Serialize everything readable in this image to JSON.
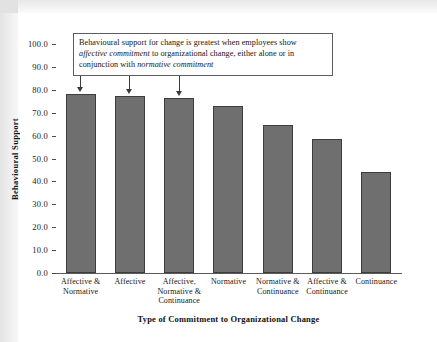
{
  "chart_data": {
    "type": "bar",
    "title": "",
    "xlabel": "Type of Commitment to Organizational Change",
    "ylabel": "Behavioural Support",
    "ylim": [
      0,
      100
    ],
    "ytick_step": 10,
    "grid": false,
    "legend": "none",
    "categories": [
      "Affective & Normative",
      "Affective",
      "Affective, Normative & Continuance",
      "Normative",
      "Normative & Continuance",
      "Affective & Continuance",
      "Continuance"
    ],
    "values": [
      78.0,
      77.2,
      76.5,
      73.0,
      64.5,
      58.5,
      44.0
    ],
    "ytick_labels": [
      "100.0",
      "90.0",
      "80.0",
      "70.0",
      "60.0",
      "50.0",
      "40.0",
      "30.0",
      "20.0",
      "10.0",
      "0.0"
    ],
    "bar_color": "#6f6f6f",
    "bar_edge_color": "#3d3d3d",
    "axis_color": "#5a5a5a",
    "annotation": {
      "line1_part1": "Behavioural support for change is greatest when employees show ",
      "line1_emphasis": "",
      "text_segments": [
        {
          "text": "Behavioural support for change is greatest when employees show ",
          "italic": false
        },
        {
          "text": "affective commitment",
          "italic": true
        },
        {
          "text": " to organizational change, either alone or in conjunction with ",
          "italic": false
        },
        {
          "text": "normative commitment",
          "italic": true
        }
      ],
      "points_to": [
        0,
        1,
        2
      ]
    }
  },
  "axis": {
    "y_title": "Behavioural Support",
    "x_title": "Type of Commitment to Organizational Change"
  }
}
